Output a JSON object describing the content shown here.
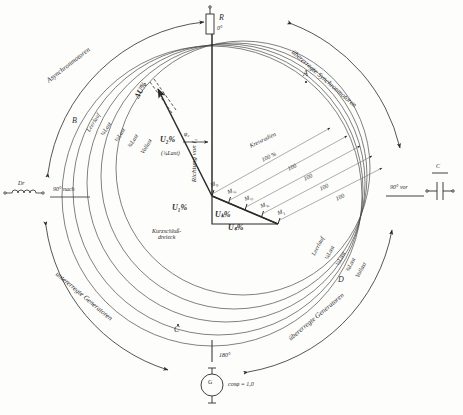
{
  "figure": {
    "type": "phasor-circle-diagram"
  },
  "quadrant_labels": {
    "upper_left": "Asynchronmotoren",
    "upper_right": "übererregte Synchronmotoren",
    "lower_left": "untererregte Generatoren",
    "lower_right": "übererregte Generatoren"
  },
  "axis_markers": {
    "top": {
      "symbol": "R",
      "angle": "0°"
    },
    "bottom": {
      "symbol": "G",
      "angle": "180°",
      "note": "cosφ = 1,0"
    },
    "left": {
      "symbol": "Dr",
      "angle": "90° nach"
    },
    "right": {
      "symbol": "C",
      "angle": "90° vor"
    }
  },
  "points": {
    "A": "A",
    "B": "B",
    "C": "C",
    "D": "D"
  },
  "load_series": {
    "caption": "Belastungskurven",
    "labels": [
      "Leerlauf",
      "¼Last",
      "½Last",
      "¾Last",
      "Vollast"
    ]
  },
  "load_markers": {
    "labels": [
      "M0",
      "M¼",
      "M½",
      "M¾",
      "M1"
    ],
    "display": [
      "M",
      "M",
      "M",
      "M",
      "M"
    ],
    "subs": [
      "0",
      "¼",
      "½",
      "¾",
      "1"
    ]
  },
  "radii": {
    "caption": "Kreisradien",
    "primary": "100 %",
    "repeats": [
      "100",
      "100",
      "100",
      "100"
    ]
  },
  "vectors": {
    "u1": "U₁%",
    "u2": "U₂%",
    "u2_note": "(¾Last)",
    "uk": "Uₖ%",
    "us": "Uₛ%",
    "delta_u": "ΔU%",
    "phi2": "φ₂",
    "direction": "Richtung von I₂"
  },
  "triangle": {
    "line1": "Kurzschluß-",
    "line2": "dreieck"
  },
  "colors": {
    "ink": "#2b2b2b",
    "line": "#3a3a3a",
    "thin": "#6a6a6a",
    "paper": "#fdfdfb"
  }
}
